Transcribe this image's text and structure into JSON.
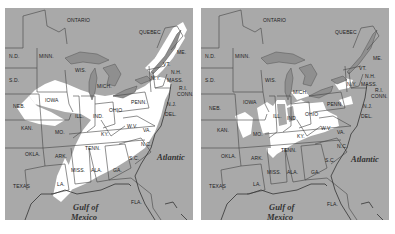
{
  "maps": [
    {
      "id": "left",
      "description": "Eastern United States with broad white highlighted region",
      "highlight_color": "#ffffff",
      "base_color": "#a9a9a9"
    },
    {
      "id": "right",
      "description": "Eastern United States with smaller scattered white highlighted patches",
      "highlight_color": "#ffffff",
      "base_color": "#a9a9a9"
    }
  ],
  "labels": {
    "ontario": "ONTARIO",
    "quebec": "QUEBEC",
    "nd": "N.D.",
    "minn": "MINN.",
    "sd": "S.D.",
    "wis": "WIS.",
    "mich": "MICH.",
    "ny": "N.Y.",
    "me": "ME.",
    "vt": "VT.",
    "nh": "N.H.",
    "mass": "MASS.",
    "ri": "R.I.",
    "conn": "CONN.",
    "nj": "N.J.",
    "del": "DEL.",
    "md": "MD.",
    "iowa": "IOWA",
    "neb": "NEB.",
    "ill": "ILL.",
    "ind": "IND.",
    "ohio": "OHIO",
    "penn": "PENN.",
    "kan": "KAN.",
    "mo": "MO.",
    "ky": "KY.",
    "wv": "W.V.",
    "va": "VA.",
    "okla": "OKLA.",
    "ark": "ARK.",
    "tenn": "TENN.",
    "nc": "N.C.",
    "sc": "S.C.",
    "texas": "TEXAS",
    "miss": "MISS.",
    "ala": "ALA.",
    "ga": "GA.",
    "la": "LA.",
    "fla": "FLA.",
    "atlantic": "Atlantic",
    "gulf_line1": "Gulf of",
    "gulf_line2": "Mexico"
  }
}
